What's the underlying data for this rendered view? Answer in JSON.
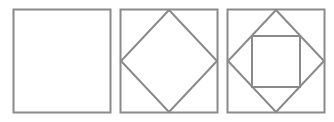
{
  "diagram": {
    "title": "",
    "stroke_color": "#8a8a8a",
    "background": "#ffffff",
    "panels": [
      {
        "name": "panel-square",
        "x": 13,
        "y": 9,
        "w": 98,
        "h": 104,
        "diamond": false,
        "inner_square": false
      },
      {
        "name": "panel-square-with-diamond",
        "x": 120,
        "y": 9,
        "w": 98,
        "h": 104,
        "diamond": true,
        "inner_square": false
      },
      {
        "name": "panel-square-diamond-inner-square",
        "x": 227,
        "y": 9,
        "w": 98,
        "h": 104,
        "diamond": true,
        "inner_square": true
      }
    ]
  }
}
